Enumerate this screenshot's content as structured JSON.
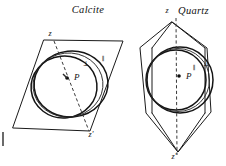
{
  "figure": {
    "kind": "optical-indicatrix-diagram",
    "background_color": "#ffffff",
    "ink_color": "#111111",
    "panels": [
      {
        "id": "calcite",
        "title": "Calcite",
        "title_x": 88,
        "title_y": 13,
        "outline_shape": "rhombus",
        "axis": {
          "top_label": "z",
          "bottom_label": "z'",
          "top_label_x": 50,
          "top_label_y": 36,
          "bottom_label_x": 91,
          "bottom_label_y": 137,
          "style": "dashed"
        },
        "center_point": {
          "label": "P",
          "label_x": 74,
          "label_y": 80,
          "dot_x": 67,
          "dot_y": 78
        },
        "ray_labels": [
          {
            "symbol": "⊥",
            "name": "perpendicular",
            "x": 86,
            "y": 66
          },
          {
            "symbol": "‖",
            "name": "parallel",
            "x": 103,
            "y": 60
          }
        ],
        "curve_count": 2,
        "curve_note": "two overlapping ovals, offset toward lower-left"
      },
      {
        "id": "quartz",
        "title": "Quartz",
        "title_x": 178,
        "title_y": 14,
        "outline_shape": "hexagonal-prism-section",
        "axis": {
          "top_label": "z",
          "bottom_label": "z'",
          "top_label_x": 167,
          "top_label_y": 13,
          "bottom_label_x": 174,
          "bottom_label_y": 159,
          "style": "dashed"
        },
        "center_point": {
          "label": "P",
          "label_x": 186,
          "label_y": 79,
          "dot_x": 179,
          "dot_y": 76
        },
        "ray_labels": [
          {
            "symbol": "‖",
            "name": "parallel",
            "x": 194,
            "y": 69
          },
          {
            "symbol": "⊥",
            "name": "perpendicular",
            "x": 206,
            "y": 66
          }
        ],
        "curve_count": 2,
        "curve_note": "two near-concentric circles, inner slightly offset left"
      }
    ],
    "edge_marks": [
      {
        "name": "left-margin-tick",
        "x": 3,
        "y": 132,
        "height": 14
      }
    ]
  }
}
